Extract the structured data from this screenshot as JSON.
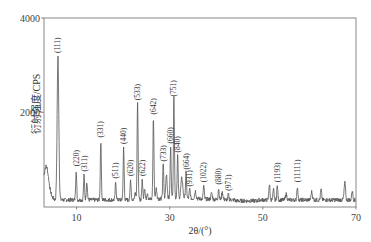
{
  "chart_data": {
    "type": "line",
    "title": "",
    "xlabel": "2θ/(°)",
    "ylabel": "衍射强度/CPS",
    "xlim": [
      3,
      70
    ],
    "ylim": [
      0,
      4000
    ],
    "x_ticks": [
      10,
      30,
      50,
      70
    ],
    "y_ticks": [
      2000,
      4000
    ],
    "grid": false,
    "legend": null,
    "series": [
      {
        "name": "XRD pattern",
        "color": "#555555"
      }
    ],
    "peaks": [
      {
        "label": "(111)",
        "x": 6.0,
        "y": 3170
      },
      {
        "label": "(220)",
        "x": 9.9,
        "y": 770
      },
      {
        "label": "(311)",
        "x": 11.6,
        "y": 660
      },
      {
        "label": "(331)",
        "x": 15.2,
        "y": 1380
      },
      {
        "label": "(511)",
        "x": 18.4,
        "y": 510
      },
      {
        "label": "(440)",
        "x": 20.1,
        "y": 1240
      },
      {
        "label": "(620)",
        "x": 21.6,
        "y": 560
      },
      {
        "label": "(533)",
        "x": 23.1,
        "y": 2170
      },
      {
        "label": "(622)",
        "x": 24.1,
        "y": 560
      },
      {
        "label": "(642)",
        "x": 26.5,
        "y": 1870
      },
      {
        "label": "(733)",
        "x": 28.6,
        "y": 870
      },
      {
        "label": "(660)",
        "x": 30.2,
        "y": 1250
      },
      {
        "label": "(751)",
        "x": 30.9,
        "y": 2250
      },
      {
        "label": "(840)",
        "x": 31.7,
        "y": 1060
      },
      {
        "label": "(664)",
        "x": 33.5,
        "y": 700
      },
      {
        "label": "(931)",
        "x": 34.3,
        "y": 340
      },
      {
        "label": "(1022)",
        "x": 37.3,
        "y": 430
      },
      {
        "label": "(880)",
        "x": 40.5,
        "y": 380
      },
      {
        "label": "(971)",
        "x": 42.6,
        "y": 250
      },
      {
        "label": "(1193)",
        "x": 53.1,
        "y": 430
      },
      {
        "label": "(11111)",
        "x": 57.4,
        "y": 430
      }
    ]
  },
  "axis": {
    "x_tick_labels": [
      "10",
      "30",
      "50",
      "70"
    ],
    "y_tick_labels": [
      "2000",
      "4000"
    ],
    "x_title": "2θ/(°)",
    "y_title": "衍射强度/CPS"
  }
}
